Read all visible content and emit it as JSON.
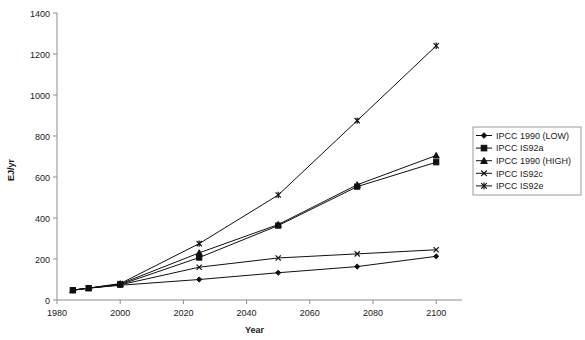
{
  "chart_data": {
    "type": "line",
    "title": "",
    "xlabel": "Year",
    "ylabel": "EJ/yr",
    "xlim": [
      1980,
      2105
    ],
    "ylim": [
      0,
      1400
    ],
    "xticks": [
      1980,
      2000,
      2020,
      2040,
      2060,
      2080,
      2100
    ],
    "yticks": [
      0,
      200,
      400,
      600,
      800,
      1000,
      1200,
      1400
    ],
    "grid": false,
    "legend_position": "right",
    "x": [
      1985,
      1990,
      2000,
      2025,
      2050,
      2075,
      2100
    ],
    "series": [
      {
        "name": "IPCC 1990 (LOW)",
        "marker": "diamond",
        "values": [
          48,
          58,
          72,
          100,
          133,
          163,
          213
        ]
      },
      {
        "name": "IPCC IS92a",
        "marker": "square",
        "values": [
          48,
          58,
          75,
          207,
          363,
          553,
          672
        ]
      },
      {
        "name": "IPCC 1990 (HIGH)",
        "marker": "triangle",
        "values": [
          48,
          58,
          78,
          230,
          368,
          562,
          705
        ]
      },
      {
        "name": "IPCC IS92c",
        "marker": "x",
        "values": [
          48,
          58,
          74,
          160,
          205,
          225,
          245
        ]
      },
      {
        "name": "IPCC IS92e",
        "marker": "star",
        "values": [
          48,
          58,
          80,
          275,
          512,
          875,
          1240
        ]
      }
    ],
    "colors": {
      "line": "#101010",
      "axis": "#8c8c8c",
      "text": "#1a1a1a",
      "background": "#ffffff"
    }
  }
}
